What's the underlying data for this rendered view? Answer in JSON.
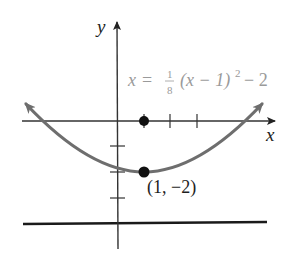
{
  "figure": {
    "axes": {
      "x_label": "x",
      "y_label": "y"
    },
    "equation": {
      "lhs": "x",
      "equals": "=",
      "frac_num": "1",
      "frac_den": "8",
      "body": "(x − 1)",
      "exponent": "2",
      "tail": "− 2"
    },
    "vertex": {
      "label": "(1, −2)",
      "x": 1,
      "y": -2
    },
    "focus": {
      "x": 1,
      "y": 0
    },
    "directrix": {
      "y": -4
    },
    "colors": {
      "curve": "#6e6e6e",
      "axes": "#333333",
      "points": "#111111",
      "equation_text": "#9a9a9a",
      "directrix": "#1a1a1a"
    }
  }
}
